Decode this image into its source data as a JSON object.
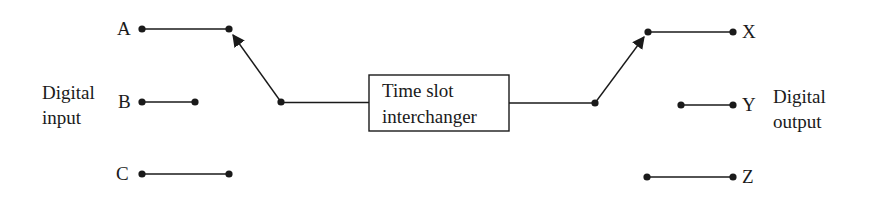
{
  "diagram": {
    "type": "time-slot-interchange switching",
    "stroke_color": "#1a1a1a",
    "left_group": {
      "label_line1": "Digital",
      "label_line2": "input",
      "ports": [
        {
          "name": "A"
        },
        {
          "name": "B"
        },
        {
          "name": "C"
        }
      ]
    },
    "center_block": {
      "line1": "Time slot",
      "line2": "interchanger"
    },
    "right_group": {
      "label_line1": "Digital",
      "label_line2": "output",
      "ports": [
        {
          "name": "X"
        },
        {
          "name": "Y"
        },
        {
          "name": "Z"
        }
      ]
    },
    "connections": [
      {
        "from": "A",
        "to": "Time slot interchanger",
        "via": "input switch arm"
      },
      {
        "from": "Time slot interchanger",
        "to": "X",
        "via": "output switch arm"
      }
    ]
  }
}
